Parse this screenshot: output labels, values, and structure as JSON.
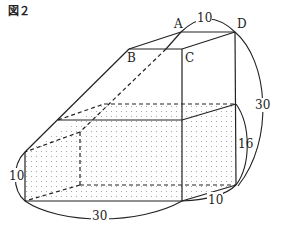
{
  "figure": {
    "title": "図２",
    "vertex_labels": {
      "A": "A",
      "B": "B",
      "C": "C",
      "D": "D"
    },
    "dimensions": {
      "top_AD": "10",
      "right_height": "30",
      "water_height_back": "16",
      "water_height_front": "10",
      "bottom_length": "30",
      "bottom_depth": "10"
    },
    "water_fill": "dotted",
    "colors": {
      "line": "#222222",
      "dots": "#9a9a9a",
      "background": "#ffffff"
    }
  }
}
